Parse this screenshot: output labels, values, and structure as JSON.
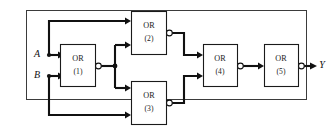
{
  "diagram": {
    "type": "logic-circuit",
    "colors": {
      "frame": "#3b3b3b",
      "wire": "#111111",
      "gate_outline": "#1a1a1a",
      "background": "#ffffff",
      "text": "#1a1a1a"
    },
    "frame": {
      "x": 26,
      "y": 10,
      "width": 281,
      "height": 90
    },
    "inputs": [
      {
        "id": "A",
        "label": "A",
        "label_x": 40,
        "label_y": 44
      },
      {
        "id": "B",
        "label": "B",
        "label_x": 40,
        "label_y": 71
      }
    ],
    "outputs": [
      {
        "id": "Y",
        "label": "Y",
        "label_x": 320,
        "label_y": 66
      }
    ],
    "gates": [
      {
        "id": "g1",
        "type_label": "OR",
        "number_label": "(1)",
        "inverted_output": true,
        "x": 60,
        "y": 44,
        "width": 36,
        "height": 43
      },
      {
        "id": "g2",
        "type_label": "OR",
        "number_label": "(2)",
        "inverted_output": true,
        "x": 131,
        "y": 11,
        "width": 36,
        "height": 44
      },
      {
        "id": "g3",
        "type_label": "OR",
        "number_label": "(3)",
        "inverted_output": true,
        "x": 131,
        "y": 81,
        "width": 36,
        "height": 44
      },
      {
        "id": "g4",
        "type_label": "OR",
        "number_label": "(4)",
        "inverted_output": true,
        "x": 203,
        "y": 44,
        "width": 35,
        "height": 43
      },
      {
        "id": "g5",
        "type_label": "OR",
        "number_label": "(5)",
        "inverted_output": true,
        "x": 264,
        "y": 44,
        "width": 35,
        "height": 43
      }
    ],
    "connections": [
      {
        "from": "A",
        "to": "g1.in1"
      },
      {
        "from": "A",
        "to": "g2.in1"
      },
      {
        "from": "B",
        "to": "g1.in2"
      },
      {
        "from": "B",
        "to": "g3.in2"
      },
      {
        "from": "g1.out",
        "to": "g2.in2"
      },
      {
        "from": "g1.out",
        "to": "g3.in1"
      },
      {
        "from": "g2.out",
        "to": "g4.in1"
      },
      {
        "from": "g3.out",
        "to": "g4.in2"
      },
      {
        "from": "g4.out",
        "to": "g5.in1"
      },
      {
        "from": "g5.out",
        "to": "Y"
      }
    ]
  }
}
